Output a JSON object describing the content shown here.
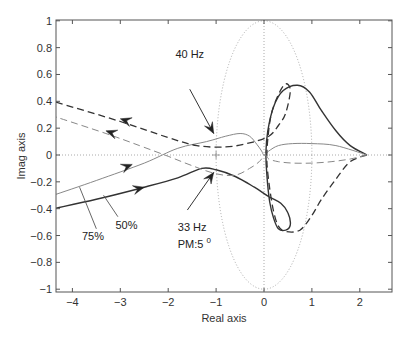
{
  "chart_data": {
    "type": "line",
    "title": "",
    "subtitle": "",
    "xlabel": "Real axis",
    "ylabel": "Imag axis",
    "xlim": [
      -4.4,
      2.65
    ],
    "ylim": [
      -1.02,
      1.0
    ],
    "xticks": [
      -4,
      -3,
      -2,
      -1,
      0,
      1,
      2
    ],
    "xtick_labels": [
      "−4",
      "−3",
      "−2",
      "−1",
      "0",
      "1",
      "2"
    ],
    "yticks": [
      1,
      0.8,
      0.6,
      0.4,
      0.2,
      0,
      -0.2,
      -0.4,
      -0.6,
      -0.8,
      -1
    ],
    "ytick_labels": [
      "1",
      "0.8",
      "0.6",
      "0.4",
      "0.2",
      "0",
      "−0.2",
      "−0.4",
      "−0.6",
      "−0.8",
      "−1"
    ],
    "grid": false,
    "legend": null,
    "reference": {
      "unit_circle": {
        "center": [
          0,
          0
        ],
        "radius": 1,
        "style": "dotted"
      },
      "zero_lines": {
        "style": "dotted"
      },
      "critical_point": {
        "x": -1,
        "y": 0,
        "marker": "+"
      }
    },
    "series": [
      {
        "name": "50% (solid, dark)",
        "style": "solid",
        "color": "#333333",
        "width": 1.4,
        "x": [
          -4.4,
          -3.5,
          -2.5,
          -1.8,
          -1.3,
          -1.0,
          -0.6,
          -0.2,
          0.1,
          0.35,
          0.5,
          0.55,
          0.45,
          0.3,
          0.2,
          0.12,
          0.06,
          0.04,
          0.08,
          0.2,
          0.4,
          0.7,
          0.95,
          1.2,
          1.5,
          1.8,
          2.15
        ],
        "y": [
          -0.4,
          -0.33,
          -0.24,
          -0.17,
          -0.1,
          -0.11,
          -0.16,
          -0.24,
          -0.31,
          -0.36,
          -0.43,
          -0.52,
          -0.56,
          -0.55,
          -0.47,
          -0.35,
          -0.15,
          0.02,
          0.18,
          0.36,
          0.48,
          0.52,
          0.47,
          0.33,
          0.18,
          0.07,
          0.0
        ]
      },
      {
        "name": "75% (solid, light)",
        "style": "solid",
        "color": "#888888",
        "width": 1.0,
        "x": [
          -4.4,
          -3.5,
          -2.5,
          -1.8,
          -1.2,
          -0.8,
          -0.5,
          -0.3,
          -0.15,
          -0.05,
          0.0,
          0.1,
          0.3,
          0.6,
          1.0,
          1.5,
          2.15
        ],
        "y": [
          -0.3,
          -0.19,
          -0.06,
          0.05,
          0.1,
          0.14,
          0.16,
          0.14,
          0.08,
          0.03,
          0.0,
          0.03,
          0.07,
          0.085,
          0.085,
          0.07,
          0.0
        ]
      },
      {
        "name": "50% return (dashed, dark)",
        "style": "dashed",
        "color": "#333333",
        "width": 1.3,
        "x": [
          2.15,
          1.8,
          1.5,
          1.2,
          1.0,
          0.75,
          0.45,
          0.3,
          0.2,
          0.12,
          0.06,
          0.08,
          0.15,
          0.3,
          0.45,
          0.55,
          0.45,
          0.3,
          0.1,
          -0.3,
          -0.8,
          -1.4,
          -2.0,
          -3.0,
          -4.4
        ],
        "y": [
          0.0,
          -0.05,
          -0.18,
          -0.33,
          -0.45,
          -0.56,
          -0.57,
          -0.53,
          -0.42,
          -0.25,
          -0.05,
          0.12,
          0.3,
          0.45,
          0.53,
          0.48,
          0.31,
          0.22,
          0.14,
          0.09,
          0.06,
          0.07,
          0.13,
          0.25,
          0.4
        ]
      },
      {
        "name": "75% return (dashed, light)",
        "style": "dashed",
        "color": "#888888",
        "width": 1.0,
        "x": [
          2.15,
          1.8,
          1.4,
          1.0,
          0.6,
          0.3,
          0.1,
          0.02,
          -0.1,
          -0.3,
          -0.6,
          -1.0,
          -1.5,
          -2.0,
          -2.6,
          -3.3,
          -4.4
        ],
        "y": [
          0.0,
          -0.03,
          -0.05,
          -0.06,
          -0.06,
          -0.05,
          -0.03,
          0.0,
          -0.05,
          -0.1,
          -0.15,
          -0.14,
          -0.08,
          -0.01,
          0.07,
          0.16,
          0.29
        ]
      }
    ],
    "arrows": [
      {
        "on": "50% return (dashed, dark)",
        "at": [
          -3.0,
          0.27
        ],
        "direction": "left"
      },
      {
        "on": "75% return (dashed, light)",
        "at": [
          -3.3,
          0.18
        ],
        "direction": "left"
      },
      {
        "on": "75% (solid, light)",
        "at": [
          -2.75,
          -0.07
        ],
        "direction": "right"
      },
      {
        "on": "50% (solid, dark)",
        "at": [
          -2.5,
          -0.24
        ],
        "direction": "right"
      }
    ],
    "annotations": [
      {
        "text": "40 Hz",
        "label_at": [
          -1.85,
          0.72
        ],
        "arrow_from": [
          -1.55,
          0.49
        ],
        "arrow_to": [
          -1.05,
          0.16
        ]
      },
      {
        "text": "33 Hz",
        "label_at": [
          -1.8,
          -0.57
        ],
        "arrow_from": [
          -1.6,
          -0.41
        ],
        "arrow_to": [
          -1.05,
          -0.13
        ]
      },
      {
        "text": "PM:5",
        "superscript": "0",
        "label_at": [
          -1.8,
          -0.69
        ]
      },
      {
        "text": "75%",
        "label_at": [
          -3.8,
          -0.63
        ],
        "leader_from": [
          -3.5,
          -0.55
        ],
        "leader_to": [
          -3.85,
          -0.24
        ]
      },
      {
        "text": "50%",
        "label_at": [
          -3.1,
          -0.55
        ],
        "leader_from": [
          -3.05,
          -0.46
        ],
        "leader_to": [
          -3.35,
          -0.3
        ]
      }
    ]
  }
}
